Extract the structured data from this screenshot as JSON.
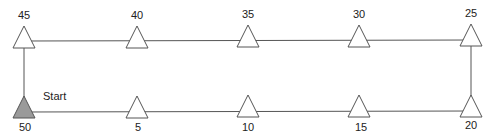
{
  "diagram": {
    "start_label": "Start",
    "top_row": [
      {
        "label": "45",
        "x": 24
      },
      {
        "label": "40",
        "x": 137
      },
      {
        "label": "35",
        "x": 248
      },
      {
        "label": "30",
        "x": 359
      },
      {
        "label": "25",
        "x": 471
      }
    ],
    "bottom_row": [
      {
        "label": "50",
        "x": 24,
        "filled": true
      },
      {
        "label": "5",
        "x": 137
      },
      {
        "label": "10",
        "x": 248
      },
      {
        "label": "15",
        "x": 359
      },
      {
        "label": "20",
        "x": 471
      }
    ],
    "colors": {
      "line": "#555555",
      "start_fill": "#9a9a9a",
      "marker_fill": "#ffffff"
    }
  }
}
